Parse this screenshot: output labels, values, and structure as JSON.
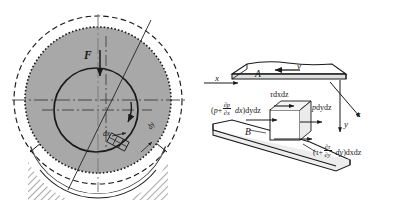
{
  "figure": {
    "colors": {
      "line": "#1a1a1a",
      "shell_fill": "#a8a8a8",
      "paper": "#ffffff",
      "hatch": "#1a1a1a"
    }
  },
  "left_panel": {
    "name": "journal-bearing-cross-section",
    "labels": {
      "load_force": "F",
      "element_dx": "dx",
      "element_dy": "dy"
    },
    "elements": {
      "outer_dashed_circle": "bearing-housing-outline",
      "shell_circle": "bearing-shell-dotted",
      "journal_circle": "journal-shaft",
      "rotation_arrow": "journal-rotation-direction",
      "load_arrow": "load-force-arrow",
      "centerline_horizontal": "horizontal-centerline",
      "centerline_vertical": "vertical-centerline",
      "eccentricity_line": "line-of-centers",
      "support_arc": "hatched-bearing-support",
      "film_element": "lubricant-film-element"
    }
  },
  "right_panel": {
    "name": "film-element-force-balance",
    "axes": {
      "x": "x",
      "y": "y",
      "z": "z"
    },
    "plates": {
      "moving_plate": "A",
      "fixed_plate": "B"
    },
    "velocity": {
      "symbol": "v",
      "direction": "leftward"
    },
    "forces": {
      "shear_top": {
        "tau": "τ",
        "area": "dxdz",
        "full": "τdxdz"
      },
      "pressure_right": {
        "p": "p",
        "area": "dydz",
        "full": "pdydz"
      },
      "pressure_left": {
        "open": "(",
        "p": "p",
        "plus": "+",
        "num": "∂p",
        "den": "∂x",
        "dx": "dx",
        "close": ")",
        "area": "dydz"
      },
      "shear_bottom": {
        "open": "(",
        "tau": "τ",
        "plus": "+",
        "num": "∂τ",
        "den": "∂y",
        "dy": "dy",
        "close": ")",
        "area": "dxdz"
      }
    },
    "elements": {
      "cube": "fluid-element-cube",
      "arrow_shear_top": "shear-stress-top-arrow",
      "arrow_pressure_left": "pressure-left-arrow",
      "arrow_pressure_right": "pressure-right-arrow",
      "arrow_shear_bottom": "shear-stress-bottom-arrow"
    }
  }
}
